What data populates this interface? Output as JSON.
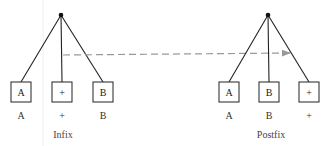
{
  "diagram": {
    "trees": [
      {
        "caption": "Infix",
        "nodes": [
          "A",
          "+",
          "B"
        ],
        "labels": [
          "A",
          "+",
          "B"
        ]
      },
      {
        "caption": "Postfix",
        "nodes": [
          "A",
          "B",
          "+"
        ],
        "labels": [
          "A",
          "B",
          "+"
        ]
      }
    ],
    "arrow": {
      "style": "dashed",
      "direction": "left-to-right",
      "color": "#999999"
    },
    "colors": {
      "line": "#222222",
      "box": "#222222",
      "root": "#111111"
    }
  }
}
